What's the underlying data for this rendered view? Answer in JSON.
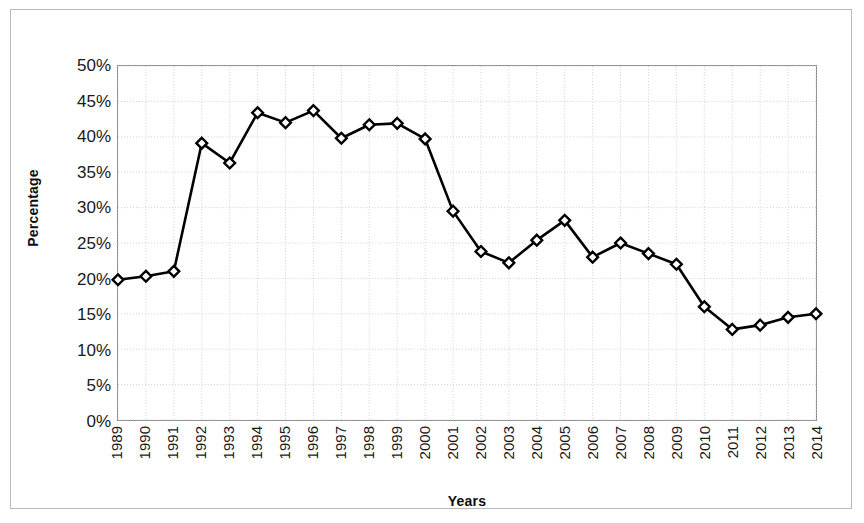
{
  "chart_data": {
    "type": "line",
    "title": "",
    "xlabel": "Years",
    "ylabel": "Percentage",
    "categories": [
      "1989",
      "1990",
      "1991",
      "1992",
      "1993",
      "1994",
      "1995",
      "1996",
      "1997",
      "1998",
      "1999",
      "2000",
      "2001",
      "2002",
      "2003",
      "2004",
      "2005",
      "2006",
      "2007",
      "2008",
      "2009",
      "2010",
      "2011",
      "2012",
      "2013",
      "2014"
    ],
    "values": [
      19.8,
      20.3,
      21.0,
      39.1,
      36.3,
      43.4,
      42.0,
      43.7,
      39.8,
      41.7,
      41.9,
      39.7,
      29.5,
      23.8,
      22.2,
      25.4,
      28.2,
      23.0,
      25.0,
      23.5,
      22.0,
      16.0,
      12.8,
      13.4,
      14.5,
      15.0
    ],
    "ylim": [
      0,
      50
    ],
    "ytick_labels": [
      "0%",
      "5%",
      "10%",
      "15%",
      "20%",
      "25%",
      "30%",
      "35%",
      "40%",
      "45%",
      "50%"
    ],
    "ytick_values": [
      0,
      5,
      10,
      15,
      20,
      25,
      30,
      35,
      40,
      45,
      50
    ],
    "grid": true,
    "legend": "none",
    "marker": "diamond",
    "series_color": "#000000",
    "grid_color": "#d0d0d0",
    "axis_color": "#8a8a8a",
    "border_color": "#b9b9b9"
  }
}
